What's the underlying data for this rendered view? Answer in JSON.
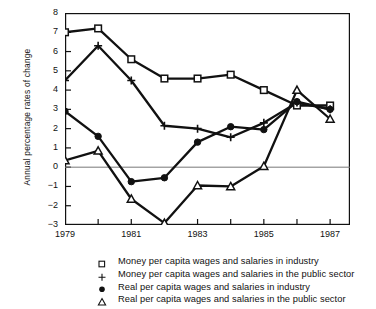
{
  "chart_data": {
    "type": "line",
    "title": "",
    "xlabel": "",
    "ylabel": "Annual percentage rates of change",
    "x": [
      1979,
      1980,
      1981,
      1982,
      1983,
      1984,
      1985,
      1986,
      1987
    ],
    "xlim": [
      1979,
      1987.6
    ],
    "ylim": [
      -3,
      8
    ],
    "xticks": [
      1979,
      1980,
      1981,
      1982,
      1983,
      1984,
      1985,
      1986,
      1987
    ],
    "xticklabels": [
      "1979",
      "",
      "1981",
      "",
      "1983",
      "",
      "1985",
      "",
      "1987"
    ],
    "yticks": [
      -3,
      -2,
      -1,
      0,
      1,
      2,
      3,
      4,
      5,
      6,
      7,
      8
    ],
    "yticklabels": [
      "−3",
      "−2",
      "−1",
      "0",
      "1",
      "2",
      "3",
      "4",
      "5",
      "6",
      "7",
      "8"
    ],
    "grid": false,
    "zero_line": true,
    "legend_position": "below",
    "series": [
      {
        "name": "Money per capita wages and salaries in industry",
        "marker": "open-square",
        "values": [
          7.0,
          7.2,
          5.6,
          4.6,
          4.6,
          4.8,
          4.0,
          3.2,
          3.2
        ]
      },
      {
        "name": "Money per capita wages and salaries in the public sector",
        "marker": "plus",
        "values": [
          4.5,
          6.3,
          4.5,
          2.15,
          2.0,
          1.55,
          2.3,
          3.35,
          3.0
        ]
      },
      {
        "name": "Real per capita wages and salaries in industry",
        "marker": "filled-circle",
        "values": [
          2.9,
          1.6,
          -0.75,
          -0.55,
          1.3,
          2.1,
          1.95,
          3.4,
          3.0
        ]
      },
      {
        "name": "Real per capita wages and salaries in the public sector",
        "marker": "open-triangle",
        "values": [
          0.35,
          0.85,
          -1.65,
          -2.9,
          -0.95,
          -1.0,
          0.05,
          4.0,
          2.5
        ]
      }
    ]
  },
  "legend": {
    "items": [
      {
        "symbol": "open-square-symbol",
        "label": "Money per capita wages and salaries in industry"
      },
      {
        "symbol": "plus-symbol",
        "label": "Money per capita wages and salaries in the public sector"
      },
      {
        "symbol": "filled-circle-symbol",
        "label": "Real per capita wages and salaries in industry"
      },
      {
        "symbol": "open-triangle-symbol",
        "label": "Real per capita wages and salaries in the public sector"
      }
    ]
  },
  "axis": {
    "y_title": "Annual percentage rates of change"
  }
}
